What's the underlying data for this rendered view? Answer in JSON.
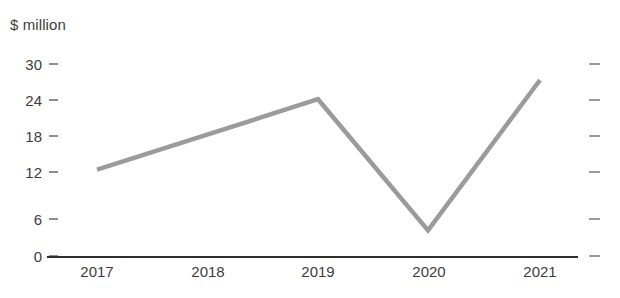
{
  "chart_data": {
    "type": "line",
    "title": "",
    "subtitle": "",
    "unit_label": "$ million",
    "xlabel": "",
    "ylabel": "$ million",
    "categories": [
      "2017",
      "2018",
      "2019",
      "2020",
      "2021"
    ],
    "values": [
      13.5,
      19.0,
      24.5,
      4.0,
      27.5
    ],
    "series": [
      {
        "name": "Value",
        "values": [
          13.5,
          19.0,
          24.5,
          4.0,
          27.5
        ]
      }
    ],
    "ylim": [
      0,
      30
    ],
    "yticks": [
      0,
      6,
      12,
      18,
      24,
      30
    ],
    "ytick_labels": [
      "0",
      "6",
      "12",
      "18",
      "24",
      "30"
    ],
    "right_ticks": [
      0,
      6,
      12,
      18,
      24,
      30
    ],
    "grid": false,
    "legend": null,
    "legend_position": "none",
    "line_color": "#9b9b9b",
    "axis_color": "#2e2e2e",
    "tick_color": "#8e8e8e",
    "text_color": "#3d3d3d",
    "background_color": "#ffffff",
    "markers": false,
    "annotations": []
  }
}
